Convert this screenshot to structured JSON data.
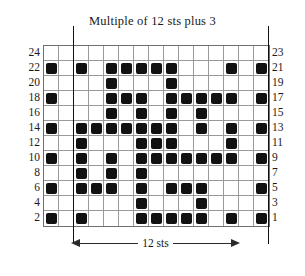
{
  "title": "Multiple of 12 sts plus 3",
  "repeat_label": "12 sts",
  "grid": {
    "columns": 15,
    "rows": 24,
    "displayed_row_bands": 12,
    "cell_px": 15,
    "fill_color": "#111111",
    "grid_line_color": "#9a9a9a",
    "border_color": "#6f6f6f",
    "repeat_marker_columns": [
      3,
      15
    ],
    "repeat_marker_color": "#111111"
  },
  "row_numbers": {
    "left": [
      "24",
      "22",
      "20",
      "18",
      "16",
      "14",
      "12",
      "10",
      "8",
      "6",
      "4",
      "2"
    ],
    "right": [
      "23",
      "21",
      "19",
      "17",
      "15",
      "13",
      "11",
      "9",
      "7",
      "5",
      "3",
      "1"
    ]
  },
  "chart_data": {
    "type": "table",
    "title": "Multiple of 12 sts plus 3",
    "xlabel": "stitches",
    "ylabel": "rows",
    "columns": [
      1,
      2,
      3,
      4,
      5,
      6,
      7,
      8,
      9,
      10,
      11,
      12,
      13,
      14,
      15
    ],
    "rows": [
      {
        "row": 24,
        "filled": []
      },
      {
        "row": 23,
        "filled": []
      },
      {
        "row": 22,
        "filled": [
          1,
          3,
          5,
          6,
          7,
          8,
          9,
          13,
          15
        ]
      },
      {
        "row": 21,
        "filled": [
          1,
          3,
          5,
          6,
          7,
          8,
          9,
          13,
          15
        ]
      },
      {
        "row": 20,
        "filled": [
          5,
          9
        ]
      },
      {
        "row": 19,
        "filled": [
          5,
          9
        ]
      },
      {
        "row": 18,
        "filled": [
          1,
          5,
          6,
          7,
          9,
          10,
          11,
          12,
          13,
          15
        ]
      },
      {
        "row": 17,
        "filled": [
          1,
          5,
          6,
          7,
          9,
          10,
          11,
          12,
          13,
          15
        ]
      },
      {
        "row": 16,
        "filled": [
          5,
          7,
          9,
          11
        ]
      },
      {
        "row": 15,
        "filled": [
          5,
          7,
          9,
          11
        ]
      },
      {
        "row": 14,
        "filled": [
          1,
          3,
          4,
          5,
          6,
          7,
          8,
          9,
          11,
          13,
          15
        ]
      },
      {
        "row": 13,
        "filled": [
          1,
          3,
          4,
          5,
          6,
          7,
          8,
          9,
          11,
          13,
          15
        ]
      },
      {
        "row": 12,
        "filled": [
          3,
          7,
          8,
          9,
          13
        ]
      },
      {
        "row": 11,
        "filled": [
          3,
          7,
          8,
          9,
          13
        ]
      },
      {
        "row": 10,
        "filled": [
          1,
          3,
          5,
          7,
          8,
          9,
          10,
          11,
          12,
          13,
          15
        ]
      },
      {
        "row": 9,
        "filled": [
          1,
          3,
          5,
          7,
          8,
          9,
          10,
          11,
          12,
          13,
          15
        ]
      },
      {
        "row": 8,
        "filled": [
          3,
          5,
          7
        ]
      },
      {
        "row": 7,
        "filled": [
          3,
          5,
          7
        ]
      },
      {
        "row": 6,
        "filled": [
          1,
          3,
          4,
          5,
          7,
          9,
          10,
          11,
          15
        ]
      },
      {
        "row": 5,
        "filled": [
          1,
          3,
          4,
          5,
          7,
          9,
          10,
          11,
          15
        ]
      },
      {
        "row": 4,
        "filled": [
          7,
          11
        ]
      },
      {
        "row": 3,
        "filled": [
          7,
          11
        ]
      },
      {
        "row": 2,
        "filled": [
          1,
          3,
          7,
          8,
          9,
          10,
          11,
          13,
          15
        ]
      },
      {
        "row": 1,
        "filled": [
          1,
          3,
          7,
          8,
          9,
          10,
          11,
          13,
          15
        ]
      }
    ],
    "bands": [
      {
        "left_label": "24",
        "right_label": "23",
        "filled": []
      },
      {
        "left_label": "22",
        "right_label": "21",
        "filled": [
          1,
          3,
          5,
          6,
          7,
          8,
          9,
          13,
          15
        ]
      },
      {
        "left_label": "20",
        "right_label": "19",
        "filled": [
          5,
          9
        ]
      },
      {
        "left_label": "18",
        "right_label": "17",
        "filled": [
          1,
          5,
          6,
          7,
          9,
          10,
          11,
          12,
          13,
          15
        ]
      },
      {
        "left_label": "16",
        "right_label": "15",
        "filled": [
          5,
          7,
          9,
          11
        ]
      },
      {
        "left_label": "14",
        "right_label": "13",
        "filled": [
          1,
          3,
          4,
          5,
          6,
          7,
          8,
          9,
          11,
          13,
          15
        ]
      },
      {
        "left_label": "12",
        "right_label": "11",
        "filled": [
          3,
          7,
          8,
          9,
          13
        ]
      },
      {
        "left_label": "10",
        "right_label": "9",
        "filled": [
          1,
          3,
          5,
          7,
          8,
          9,
          10,
          11,
          12,
          13,
          15
        ]
      },
      {
        "left_label": "8",
        "right_label": "7",
        "filled": [
          3,
          5,
          7
        ]
      },
      {
        "left_label": "6",
        "right_label": "5",
        "filled": [
          1,
          3,
          4,
          5,
          7,
          9,
          10,
          11,
          15
        ]
      },
      {
        "left_label": "4",
        "right_label": "3",
        "filled": [
          7,
          11
        ]
      },
      {
        "left_label": "2",
        "right_label": "1",
        "filled": [
          1,
          3,
          7,
          8,
          9,
          10,
          11,
          13,
          15
        ]
      }
    ]
  }
}
